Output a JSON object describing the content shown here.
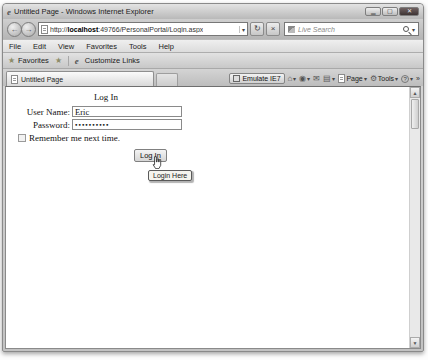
{
  "window": {
    "title": "Untitled Page - Windows Internet Explorer",
    "ie_logo": "e"
  },
  "nav": {
    "url_scheme": "http://",
    "url_host": "localhost",
    "url_path": ":49766/PersonalPortal/Login.aspx",
    "search_placeholder": "Live Search"
  },
  "menubar": {
    "items": [
      "File",
      "Edit",
      "View",
      "Favorites",
      "Tools",
      "Help"
    ]
  },
  "favorites_bar": {
    "favorites_label": "Favorites",
    "customize_links_label": "Customize Links"
  },
  "tabs": {
    "active_label": "Untitled Page"
  },
  "command_bar": {
    "emulate_label": "Emulate IE7",
    "page_label": "Page",
    "tools_label": "Tools"
  },
  "icons": {
    "back": "←",
    "forward": "→",
    "dropdown": "▾",
    "refresh": "↻",
    "stop": "×",
    "favorites_star": "★",
    "add_favorite_star": "★",
    "home": "⌂",
    "feeds": "◉",
    "mail": "✉",
    "print": "▤",
    "tools_gear": "⚙",
    "help": "?",
    "chevron": "»",
    "scroll_up": "▲",
    "scroll_down": "▼"
  },
  "login_form": {
    "heading": "Log In",
    "username_label": "User Name:",
    "username_value": "Eric",
    "password_label": "Password:",
    "password_value": "••••••••••",
    "remember_label": "Remember me next time.",
    "button_label": "Log In",
    "tooltip": "Login Here"
  },
  "colors": {
    "chrome_gray": "#c6c6c6",
    "content_bg": "#ffffff",
    "close_button": "#4a3e3e",
    "tooltip_bg": "#f4f4ee"
  }
}
